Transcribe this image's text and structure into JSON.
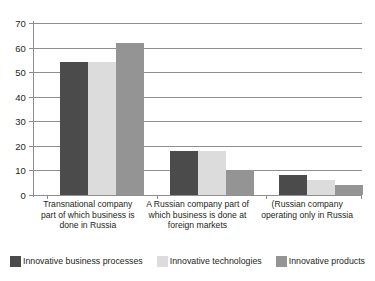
{
  "chart_data": {
    "type": "bar",
    "title": "",
    "subtitle": "",
    "xlabel": "",
    "ylabel": "",
    "ylim": [
      0,
      70
    ],
    "yticks": [
      0,
      10,
      20,
      30,
      40,
      50,
      60,
      70
    ],
    "ytick_labels": [
      "0",
      "10",
      "20",
      "30",
      "40",
      "50",
      "60",
      "70"
    ],
    "grid": true,
    "legend_position": "bottom",
    "categories": [
      "Transnational company part of which business is done in Russia",
      "A Russian company part of which business is done at foreign markets",
      "(Russian company operating only in Russia"
    ],
    "category_lines": [
      [
        "Transnational company",
        "part of which business is",
        "done in Russia"
      ],
      [
        "A Russian company part of",
        "which business is done at",
        "foreign markets"
      ],
      [
        "(Russian company",
        "operating only in Russia"
      ]
    ],
    "series": [
      {
        "name": "Innovative business processes",
        "color": "#4b4b4b",
        "values": [
          54,
          18,
          8
        ]
      },
      {
        "name": "Innovative technologies",
        "color": "#dcdcdc",
        "values": [
          54,
          18,
          6
        ]
      },
      {
        "name": "Innovative products",
        "color": "#949494",
        "values": [
          62,
          10,
          4
        ]
      }
    ]
  },
  "style": {
    "background": "#ffffff",
    "grid_color": "#8f8f8f",
    "axis_color": "#8c8c8c",
    "text_color": "#231f20"
  }
}
